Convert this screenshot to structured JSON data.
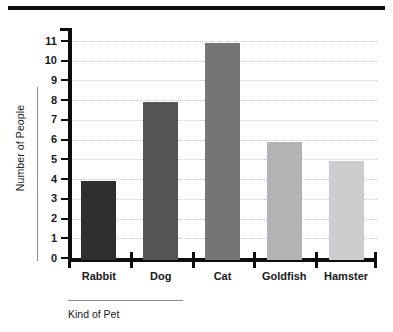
{
  "chart_data": {
    "type": "bar",
    "title": "",
    "xlabel": "Kind of Pet",
    "ylabel": "Number of People",
    "categories": [
      "Rabbit",
      "Dog",
      "Cat",
      "Goldfish",
      "Hamster"
    ],
    "values": [
      4,
      8,
      11,
      6,
      5
    ],
    "bar_colors": [
      "#302f30",
      "#555457",
      "#757578",
      "#b4b4b6",
      "#cdcdcf"
    ],
    "ylim": [
      0,
      11
    ],
    "yticks": [
      0,
      1,
      2,
      3,
      4,
      5,
      6,
      7,
      8,
      9,
      10,
      11
    ],
    "ytick_labels": [
      "0",
      "1",
      "2",
      "3",
      "4",
      "5",
      "6",
      "7",
      "8",
      "9",
      "10",
      "11"
    ],
    "grid": true,
    "grid_style": "dotted",
    "grid_color": "#c9c9c9",
    "legend": false,
    "axis_color": "#0d0d0d",
    "series": [
      {
        "name": "Number of People",
        "values": [
          4,
          8,
          11,
          6,
          5
        ]
      }
    ]
  },
  "decorations": {
    "top_rule_color": "#0d0d0d"
  }
}
